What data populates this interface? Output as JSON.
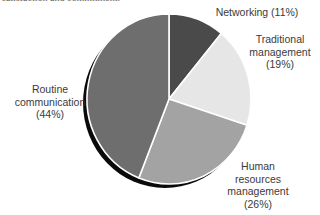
{
  "caption_cropped": "satisfaction and commitment.",
  "chart_data": {
    "type": "pie",
    "title": "",
    "slices": [
      {
        "label": "Networking",
        "value": 11,
        "color": "#4a4a4a"
      },
      {
        "label": "Traditional management",
        "value": 19,
        "color": "#e6e6e6"
      },
      {
        "label": "Human resources management",
        "value": 26,
        "color": "#a3a3a3"
      },
      {
        "label": "Routine communication",
        "value": 44,
        "color": "#6e6e6e"
      }
    ],
    "start_angle_deg": 0,
    "direction": "clockwise",
    "shadow": true,
    "legend": "none (labels placed around pie)"
  },
  "labels": {
    "networking": {
      "line1": "Networking (11%)"
    },
    "traditional": {
      "line1": "Traditional",
      "line2": "management",
      "line3": "(19%)"
    },
    "hr": {
      "line1": "Human",
      "line2": "resources",
      "line3": "management",
      "line4": "(26%)"
    },
    "routine": {
      "line1": "Routine",
      "line2": "communication",
      "line3": "(44%)"
    }
  }
}
